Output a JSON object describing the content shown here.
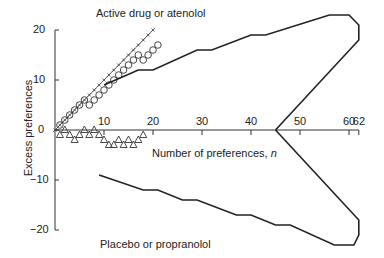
{
  "chart_data": {
    "type": "line",
    "title": "",
    "xlabel": "Number of preferences, n",
    "ylabel": "Excess preferences",
    "xlim": [
      0,
      62
    ],
    "ylim": [
      -20,
      22
    ],
    "x_ticks": [
      10,
      20,
      30,
      40,
      50,
      60,
      62
    ],
    "y_ticks": [
      -20,
      -10,
      0,
      10,
      20
    ],
    "grid": false,
    "annotations": [
      {
        "text": "Active drug or atenolol",
        "position": "top"
      },
      {
        "text": "Placebo or propranolol",
        "position": "bottom"
      }
    ],
    "series": [
      {
        "name": "crosses (reference line)",
        "marker": "+",
        "x": [
          0,
          1,
          2,
          3,
          4,
          5,
          6,
          7,
          8,
          9,
          10,
          11,
          12,
          13,
          14,
          15,
          16,
          17,
          18,
          19,
          20
        ],
        "y": [
          0,
          1,
          2,
          3,
          4,
          5,
          6,
          7,
          8,
          9,
          10,
          11,
          12,
          13,
          14,
          15,
          16,
          17,
          18,
          19,
          20
        ]
      },
      {
        "name": "circles",
        "marker": "o",
        "x": [
          1,
          2,
          3,
          4,
          5,
          6,
          7,
          8,
          9,
          10,
          11,
          12,
          13,
          14,
          15,
          16,
          17,
          18,
          19,
          20,
          21
        ],
        "y": [
          1,
          2,
          3,
          4,
          5,
          6,
          5,
          6,
          7,
          8,
          9,
          10,
          11,
          12,
          13,
          14,
          15,
          14,
          15,
          16,
          17
        ]
      },
      {
        "name": "triangles",
        "marker": "^",
        "x": [
          1,
          2,
          3,
          4,
          5,
          6,
          7,
          8,
          9,
          10,
          11,
          12,
          13,
          14,
          15,
          16,
          17,
          18
        ],
        "y": [
          -1,
          0,
          -1,
          -2,
          -1,
          0,
          -1,
          0,
          -1,
          -2,
          -3,
          -3,
          -2,
          -3,
          -2,
          -3,
          -2,
          -1
        ]
      },
      {
        "name": "upper boundary",
        "marker": "none",
        "x": [
          10,
          17,
          20,
          29,
          32,
          40,
          43,
          56,
          60,
          62,
          62,
          45
        ],
        "y": [
          9,
          12,
          12,
          16,
          16,
          19,
          19,
          23,
          23,
          21,
          18,
          0
        ]
      },
      {
        "name": "lower boundary",
        "marker": "none",
        "x": [
          9,
          18,
          21,
          26,
          29,
          37,
          40,
          45,
          48,
          57,
          61,
          62,
          62,
          45
        ],
        "y": [
          -9,
          -12,
          -12,
          -14,
          -14,
          -17,
          -17,
          -19,
          -19,
          -23,
          -23,
          -21,
          -18,
          0
        ]
      }
    ]
  },
  "labels": {
    "top_annotation": "Active drug or atenolol",
    "bottom_annotation": "Placebo or propranolol",
    "xlabel_text": "Number of preferences, ",
    "xlabel_var": "n",
    "ylabel": "Excess preferences"
  }
}
